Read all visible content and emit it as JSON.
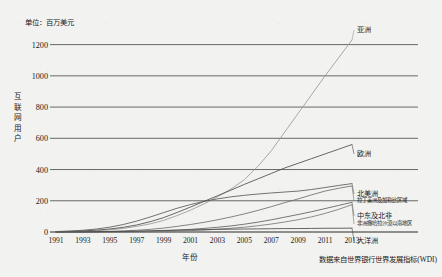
{
  "top_partial_text": "",
  "unit_note": "单位：百万美元",
  "y_axis_title_chars": [
    "互",
    "联",
    "网",
    "用",
    "户"
  ],
  "x_axis_title": "年份",
  "source_note": "数据来自世界银行世界发展指标(WDI)",
  "chart_data": {
    "type": "line",
    "title": "",
    "subtitle": "",
    "xlabel": "年份",
    "ylabel": "互联网用户",
    "unit": "百万美元",
    "grid": true,
    "legend_position": "inline-right",
    "xlim": [
      1991,
      2013
    ],
    "ylim": [
      0,
      1300
    ],
    "yticks": [
      0,
      200,
      400,
      600,
      800,
      1000,
      1200
    ],
    "ytick_labels": [
      "0",
      "200",
      "400",
      "600",
      "800",
      "1000",
      "1200"
    ],
    "xticks": [
      1991,
      1993,
      1995,
      1997,
      1999,
      2001,
      2003,
      2005,
      2007,
      2009,
      2011,
      2013
    ],
    "xtick_labels": [
      "1991",
      "1993",
      "1995",
      "1997",
      "1999",
      "2001",
      "2003",
      "2005",
      "2007",
      "2009",
      "2011",
      "2013"
    ],
    "x": [
      1991,
      1992,
      1993,
      1994,
      1995,
      1996,
      1997,
      1998,
      1999,
      2000,
      2001,
      2002,
      2003,
      2004,
      2005,
      2006,
      2007,
      2008,
      2009,
      2010,
      2011,
      2012,
      2013
    ],
    "series": [
      {
        "name": "亚洲",
        "color": "#9a9a9a",
        "label_x": 357,
        "label_y": 26,
        "values": [
          1,
          2,
          4,
          8,
          14,
          23,
          36,
          52,
          74,
          105,
          140,
          180,
          225,
          275,
          335,
          420,
          520,
          640,
          760,
          880,
          1000,
          1115,
          1230
        ]
      },
      {
        "name": "欧洲",
        "color": "#4d4d4d",
        "label_x": 357,
        "label_y": 150,
        "values": [
          2,
          4,
          7,
          12,
          19,
          30,
          45,
          66,
          92,
          125,
          160,
          196,
          232,
          268,
          305,
          340,
          375,
          410,
          440,
          470,
          500,
          530,
          560
        ]
      },
      {
        "name": "北美洲",
        "color": "#5a5a5a",
        "label_x": 357,
        "label_y": 190,
        "values": [
          3,
          6,
          11,
          19,
          31,
          48,
          70,
          96,
          124,
          152,
          176,
          196,
          212,
          225,
          235,
          243,
          250,
          256,
          262,
          272,
          285,
          298,
          310
        ]
      },
      {
        "name": "拉丁美洲及加勒比区域",
        "color": "#6e6e6e",
        "label_x": 357,
        "label_y": 197,
        "values": [
          0,
          1,
          1,
          2,
          4,
          7,
          11,
          17,
          25,
          36,
          48,
          62,
          78,
          96,
          116,
          138,
          162,
          188,
          212,
          238,
          262,
          280,
          295
        ]
      },
      {
        "name": "中东及北非",
        "color": "#5f5f5f",
        "label_x": 357,
        "label_y": 212,
        "values": [
          0,
          0,
          0,
          1,
          1,
          2,
          3,
          5,
          8,
          12,
          17,
          23,
          30,
          39,
          50,
          63,
          78,
          95,
          112,
          130,
          150,
          170,
          190
        ]
      },
      {
        "name": "非洲撒哈拉沙漠以南地区",
        "color": "#777777",
        "label_x": 357,
        "label_y": 220,
        "values": [
          0,
          0,
          0,
          0,
          1,
          1,
          2,
          3,
          4,
          6,
          9,
          13,
          18,
          24,
          31,
          40,
          51,
          64,
          79,
          97,
          119,
          145,
          175
        ]
      },
      {
        "name": "大洋洲",
        "color": "#4a4a4a",
        "label_x": 357,
        "label_y": 237,
        "values": [
          0,
          1,
          1,
          2,
          3,
          4,
          6,
          8,
          10,
          12,
          14,
          15,
          17,
          18,
          19,
          20,
          21,
          22,
          22,
          23,
          24,
          24,
          25
        ]
      }
    ]
  }
}
